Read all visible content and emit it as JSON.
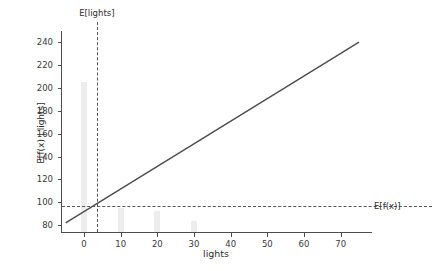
{
  "chart_data": {
    "type": "line",
    "title": "",
    "xlabel": "lights",
    "ylabel": "E[f(x) | lights]",
    "xlim": [
      -6,
      78
    ],
    "ylim": [
      74,
      248
    ],
    "grid": false,
    "legend": "none",
    "xticks": [
      0,
      10,
      20,
      30,
      40,
      50,
      60,
      70
    ],
    "xtick_labels": [
      "0",
      "10",
      "20",
      "30",
      "40",
      "50",
      "60",
      "70"
    ],
    "yticks": [
      80,
      100,
      120,
      140,
      160,
      180,
      200,
      220,
      240
    ],
    "ytick_labels": [
      "80",
      "100",
      "120",
      "140",
      "160",
      "180",
      "200",
      "220",
      "240"
    ],
    "series": [
      {
        "name": "partial dependence",
        "type": "line",
        "color": "#4d4d4d",
        "x": [
          -5,
          75
        ],
        "values": [
          82,
          240
        ]
      },
      {
        "name": "lights distribution",
        "type": "bar",
        "color": "#ededed",
        "categories": [
          0,
          10,
          20,
          30
        ],
        "values": [
          205,
          95,
          92,
          84
        ],
        "baseline": 74,
        "bar_width": 1.6
      }
    ],
    "annotations": [
      {
        "name": "expected-lights",
        "label": "E[lights]",
        "orientation": "vertical",
        "value": 3.5,
        "style": "dashed",
        "color": "#555555"
      },
      {
        "name": "expected-prediction",
        "label": "E[f(x)]",
        "orientation": "horizontal",
        "value": 97,
        "style": "dashed",
        "color": "#555555"
      }
    ]
  }
}
